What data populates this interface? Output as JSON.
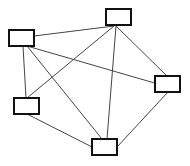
{
  "diagram": {
    "type": "graph",
    "width": 190,
    "height": 166,
    "colors": {
      "background": "#ffffff",
      "node_fill": "#ffffff",
      "node_stroke": "#111111",
      "edge_stroke": "#444444"
    },
    "nodes": [
      {
        "id": "A",
        "label": "",
        "x": 106,
        "y": 9,
        "w": 25,
        "h": 16
      },
      {
        "id": "B",
        "label": "",
        "x": 9,
        "y": 30,
        "w": 25,
        "h": 16
      },
      {
        "id": "C",
        "label": "",
        "x": 155,
        "y": 76,
        "w": 25,
        "h": 16
      },
      {
        "id": "D",
        "label": "",
        "x": 14,
        "y": 98,
        "w": 25,
        "h": 16
      },
      {
        "id": "E",
        "label": "",
        "x": 92,
        "y": 139,
        "w": 25,
        "h": 16
      }
    ],
    "edges": [
      {
        "from": "B",
        "to": "A",
        "x1": 34,
        "y1": 36,
        "x2": 114,
        "y2": 26
      },
      {
        "from": "B",
        "to": "C",
        "x1": 27,
        "y1": 46,
        "x2": 158,
        "y2": 84
      },
      {
        "from": "B",
        "to": "D",
        "x1": 23,
        "y1": 46,
        "x2": 26,
        "y2": 98
      },
      {
        "from": "B",
        "to": "E",
        "x1": 27,
        "y1": 46,
        "x2": 102,
        "y2": 139
      },
      {
        "from": "A",
        "to": "D",
        "x1": 114,
        "y1": 26,
        "x2": 27,
        "y2": 98
      },
      {
        "from": "A",
        "to": "E",
        "x1": 116,
        "y1": 26,
        "x2": 107,
        "y2": 139
      },
      {
        "from": "A",
        "to": "C",
        "x1": 116,
        "y1": 26,
        "x2": 167,
        "y2": 76
      },
      {
        "from": "D",
        "to": "E",
        "x1": 27,
        "y1": 114,
        "x2": 92,
        "y2": 147
      },
      {
        "from": "C",
        "to": "E",
        "x1": 168,
        "y1": 92,
        "x2": 117,
        "y2": 147
      }
    ]
  }
}
